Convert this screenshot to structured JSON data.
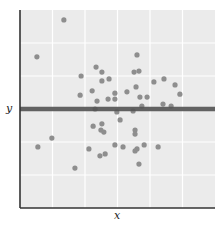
{
  "chart_data": {
    "type": "scatter",
    "title": "",
    "xlabel": "x",
    "ylabel": "y",
    "xlim": [
      0,
      6
    ],
    "ylim": [
      0,
      6
    ],
    "grid": true,
    "x_ticks_labeled": false,
    "y_ticks_labeled": false,
    "gridlines_x": [
      1,
      2,
      3,
      4,
      5
    ],
    "gridlines_y": [
      1,
      2,
      3,
      4,
      5
    ],
    "legend": null,
    "colors": {
      "panel_background": "#ebebeb",
      "grid": "#ffffff",
      "points": "#8e8e8e",
      "reference_line": "#555555",
      "axis": "#333333"
    },
    "reference_line": {
      "orientation": "horizontal",
      "y": 3.0,
      "description": "horizontal line at mean of y"
    },
    "points": [
      {
        "x": 1.35,
        "y": 5.7
      },
      {
        "x": 0.52,
        "y": 4.58
      },
      {
        "x": 3.6,
        "y": 4.64
      },
      {
        "x": 2.34,
        "y": 4.27
      },
      {
        "x": 2.52,
        "y": 4.12
      },
      {
        "x": 3.51,
        "y": 4.12
      },
      {
        "x": 3.66,
        "y": 4.15
      },
      {
        "x": 1.88,
        "y": 4.0
      },
      {
        "x": 2.52,
        "y": 3.85
      },
      {
        "x": 2.74,
        "y": 3.91
      },
      {
        "x": 4.12,
        "y": 3.82
      },
      {
        "x": 4.43,
        "y": 3.91
      },
      {
        "x": 4.77,
        "y": 3.73
      },
      {
        "x": 2.22,
        "y": 3.55
      },
      {
        "x": 2.92,
        "y": 3.48
      },
      {
        "x": 3.29,
        "y": 3.52
      },
      {
        "x": 3.57,
        "y": 3.67
      },
      {
        "x": 1.85,
        "y": 3.42
      },
      {
        "x": 2.37,
        "y": 3.24
      },
      {
        "x": 2.71,
        "y": 3.3
      },
      {
        "x": 2.92,
        "y": 3.3
      },
      {
        "x": 3.69,
        "y": 3.36
      },
      {
        "x": 3.91,
        "y": 3.36
      },
      {
        "x": 4.92,
        "y": 3.45
      },
      {
        "x": 4.4,
        "y": 3.15
      },
      {
        "x": 4.65,
        "y": 3.09
      },
      {
        "x": 3.75,
        "y": 3.09
      },
      {
        "x": 2.31,
        "y": 3.0
      },
      {
        "x": 2.98,
        "y": 2.91
      },
      {
        "x": 3.48,
        "y": 2.94
      },
      {
        "x": 3.08,
        "y": 2.67
      },
      {
        "x": 2.25,
        "y": 2.48
      },
      {
        "x": 2.52,
        "y": 2.55
      },
      {
        "x": 2.49,
        "y": 2.36
      },
      {
        "x": 2.58,
        "y": 2.3
      },
      {
        "x": 3.54,
        "y": 2.36
      },
      {
        "x": 3.54,
        "y": 2.24
      },
      {
        "x": 0.98,
        "y": 2.12
      },
      {
        "x": 0.55,
        "y": 1.85
      },
      {
        "x": 2.92,
        "y": 1.91
      },
      {
        "x": 3.17,
        "y": 1.85
      },
      {
        "x": 3.82,
        "y": 1.91
      },
      {
        "x": 4.25,
        "y": 1.85
      },
      {
        "x": 2.12,
        "y": 1.79
      },
      {
        "x": 3.6,
        "y": 1.79
      },
      {
        "x": 3.54,
        "y": 1.73
      },
      {
        "x": 2.46,
        "y": 1.58
      },
      {
        "x": 2.62,
        "y": 1.64
      },
      {
        "x": 3.66,
        "y": 1.33
      },
      {
        "x": 1.69,
        "y": 1.21
      }
    ]
  }
}
